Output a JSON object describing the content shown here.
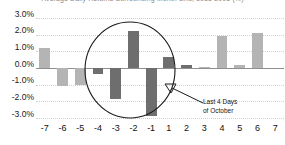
{
  "chart_data": {
    "type": "bar",
    "title": "Average Daily Returns Surrounding Month-End, 1985-2005 (%)",
    "title_clipped": true,
    "xlabel": "",
    "ylabel": "",
    "ylim": [
      -3.0,
      3.0
    ],
    "ytick_labels": [
      "3.0%",
      "2.0%",
      "1.0%",
      "0.0%",
      "-1.0%",
      "-2.0%",
      "-3.0%"
    ],
    "ytick_values": [
      3.0,
      2.0,
      1.0,
      0.0,
      -1.0,
      -2.0,
      -3.0
    ],
    "grid": true,
    "legend": "none",
    "categories": [
      "-7",
      "-6",
      "-5",
      "-4",
      "-3",
      "-2",
      "-1",
      "1",
      "2",
      "3",
      "4",
      "5",
      "6",
      "7"
    ],
    "values": [
      1.2,
      -1.1,
      -1.0,
      -0.35,
      -1.85,
      2.25,
      -2.85,
      0.65,
      0.2,
      0.05,
      1.9,
      0.2,
      2.1,
      0.0
    ],
    "bar_colors": [
      "#b4b4b4",
      "#b4b4b4",
      "#b4b4b4",
      "#6e6e6e",
      "#6e6e6e",
      "#6e6e6e",
      "#6e6e6e",
      "#6e6e6e",
      "#6e6e6e",
      "#b4b4b4",
      "#b4b4b4",
      "#b4b4b4",
      "#b4b4b4",
      "#b4b4b4"
    ],
    "annotations": [
      {
        "type": "ellipse",
        "note": "highlight circle around day -4 through day 1",
        "covers": [
          "-4",
          "-3",
          "-2",
          "-1",
          "1"
        ]
      },
      {
        "type": "arrow-label",
        "text_line1": "Last 4 Days",
        "text_line2": "of October",
        "points_to": "ellipse"
      }
    ],
    "colors": {
      "bar_light": "#b4b4b4",
      "bar_dark": "#6e6e6e",
      "gridline": "#d0d0d0",
      "zero_line": "#8f8f8f",
      "annotation_stroke": "#1a1a1a",
      "text": "#111111",
      "background": "#ffffff"
    }
  },
  "annotation": {
    "line1": "Last 4 Days",
    "line2": "of October"
  }
}
